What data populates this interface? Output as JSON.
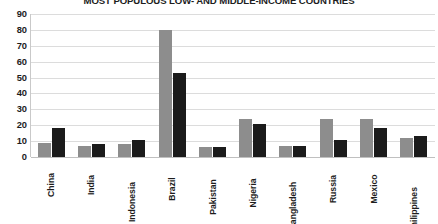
{
  "chart_data": {
    "type": "bar",
    "title": "MOST POPULOUS LOW- AND MIDDLE-INCOME COUNTRIES",
    "xlabel": "",
    "ylabel": "",
    "ylim": [
      0,
      90
    ],
    "yticks": [
      90,
      80,
      70,
      60,
      50,
      40,
      30,
      20,
      10,
      0
    ],
    "grid": true,
    "legend": "none",
    "categories": [
      "China",
      "India",
      "Indonesia",
      "Brazil",
      "Pakistan",
      "Nigeria",
      "Bangladesh",
      "Russia",
      "Mexico",
      "Philippines"
    ],
    "series": [
      {
        "name": "series-1",
        "color": "#8d8d8d",
        "values": [
          9,
          7,
          8,
          80,
          6,
          24,
          7,
          24,
          24,
          12
        ]
      },
      {
        "name": "series-2",
        "color": "#1b1b1b",
        "values": [
          18,
          8,
          11,
          53,
          6,
          21,
          7,
          11,
          18,
          13
        ]
      }
    ]
  },
  "colors": {
    "series_1": "#8d8d8d",
    "series_2": "#1b1b1b",
    "gridline": "#dcdcdc",
    "axis": "#c9c9c9",
    "text": "#1d1d1d",
    "background": "#ffffff"
  }
}
